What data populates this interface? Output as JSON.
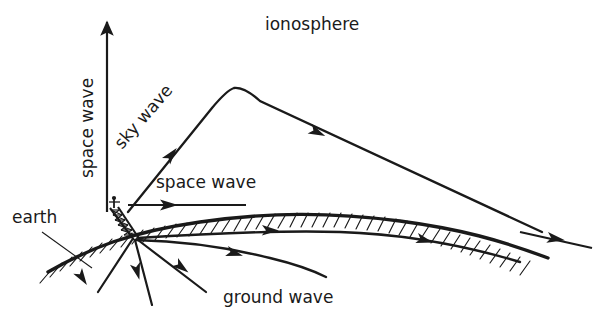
{
  "figure": {
    "name": "radio-wave-propagation-diagram",
    "background_color": "#ffffff",
    "ink_color": "#1a1a1a",
    "ionosphere_color": "#e3e3e3",
    "width": 608,
    "height": 320
  },
  "labels": {
    "ionosphere": "ionosphere",
    "space_wave_vertical": "space wave",
    "space_wave_horizontal": "space wave",
    "sky_wave": "sky wave",
    "ground_wave": "ground wave",
    "earth": "earth"
  },
  "elements": {
    "ionosphere_band": "stippled-gray-band",
    "earth_surface": "curved-hatched-ground-line",
    "antenna": "lattice-transmitting-tower",
    "vertical_space_wave_arrow": "upward-arrow",
    "horizontal_space_wave_arrow": "rightward-arrow",
    "sky_wave_path": "refracted-ray-arc",
    "ground_wave_path": "curved-surface-following-ray",
    "downward_rays": "three-ground-directed-rays",
    "earth_leader_line": "callout-line"
  }
}
